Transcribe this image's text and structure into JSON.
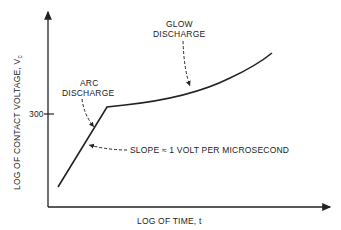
{
  "diagram": {
    "y_axis_label": "LOG OF CONTACT VOLTAGE, V",
    "y_axis_label_subscript": "c",
    "x_axis_label": "LOG OF TIME, t",
    "y_tick_label": "300",
    "annotations": {
      "arc_line1": "ARC",
      "arc_line2": "DISCHARGE",
      "glow_line1": "GLOW",
      "glow_line2": "DISCHARGE",
      "slope": "SLOPE ≈ 1 VOLT PER MICROSECOND"
    },
    "colors": {
      "ink": "#222222",
      "background": "#ffffff"
    }
  }
}
